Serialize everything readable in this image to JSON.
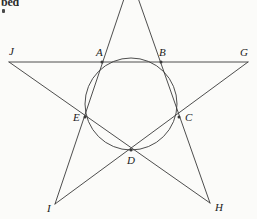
{
  "figure": {
    "background_color": "#fbfbf9",
    "stroke_color": "#3a3a3a",
    "label_color": "#1a1a1a",
    "stroke_width": 0.9,
    "width": 257,
    "height": 219
  },
  "page_fragment": {
    "text": "bed",
    "note": "clipped bold text from line above figure"
  },
  "circle": {
    "name": "inscribed-circle",
    "cx": 131,
    "cy": 104,
    "r": 46
  },
  "outer_points": [
    {
      "id": "F",
      "label": "",
      "x": 131,
      "y": -22,
      "label_x": 0,
      "label_y": 0,
      "clipped": true
    },
    {
      "id": "G",
      "label": "G",
      "x": 248,
      "y": 62,
      "label_x": 240,
      "label_y": 47
    },
    {
      "id": "H",
      "label": "H",
      "x": 210,
      "y": 203,
      "label_x": 215,
      "label_y": 202
    },
    {
      "id": "I",
      "label": "I",
      "x": 55,
      "y": 204,
      "label_x": 47,
      "label_y": 203
    },
    {
      "id": "J",
      "label": "J",
      "x": 9,
      "y": 62,
      "label_x": 9,
      "label_y": 46
    }
  ],
  "inner_points": [
    {
      "id": "A",
      "label": "A",
      "x": 102,
      "y": 62,
      "label_x": 96,
      "label_y": 47
    },
    {
      "id": "B",
      "label": "B",
      "x": 161,
      "y": 62,
      "label_x": 159,
      "label_y": 47
    },
    {
      "id": "C",
      "label": "C",
      "x": 179,
      "y": 117,
      "label_x": 185,
      "label_y": 112
    },
    {
      "id": "D",
      "label": "D",
      "x": 131,
      "y": 150,
      "label_x": 127,
      "label_y": 155
    },
    {
      "id": "E",
      "label": "E",
      "x": 85,
      "y": 117,
      "label_x": 73,
      "label_y": 112
    }
  ],
  "star_chords": [
    {
      "name": "chord-J-G",
      "x1": 9,
      "y1": 62,
      "x2": 248,
      "y2": 62
    },
    {
      "name": "chord-J-H",
      "x1": 9,
      "y1": 62,
      "x2": 210,
      "y2": 203
    },
    {
      "name": "chord-G-I",
      "x1": 248,
      "y1": 62,
      "x2": 55,
      "y2": 204
    },
    {
      "name": "chord-F-I",
      "x1": 131,
      "y1": -22,
      "x2": 55,
      "y2": 204
    },
    {
      "name": "chord-F-H",
      "x1": 131,
      "y1": -22,
      "x2": 210,
      "y2": 203
    }
  ]
}
